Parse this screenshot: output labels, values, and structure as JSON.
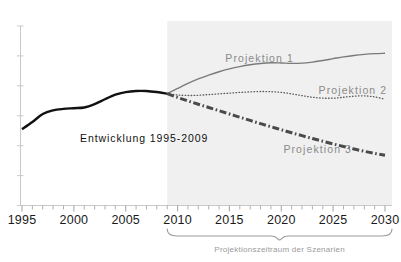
{
  "chart_data": {
    "type": "line",
    "title": "",
    "subtitle": "",
    "xlabel": "",
    "ylabel": "",
    "xlim": [
      1995,
      2030
    ],
    "ylim": [
      0,
      100
    ],
    "grid": false,
    "legend_position": "inline-annotations",
    "y_axis_labels_visible": false,
    "x_tick_labels": [
      "1995",
      "2000",
      "2005",
      "2010",
      "2015",
      "2020",
      "2025",
      "2030"
    ],
    "x_tick_values": [
      1995,
      2000,
      2005,
      2010,
      2015,
      2020,
      2025,
      2030
    ],
    "x_minor_tick_interval": 1,
    "y_minor_tick_count": 6,
    "shaded_region": {
      "label": "Projektionszeitraum",
      "x_start": 2009,
      "x_end": 2030,
      "color": "#f0f0f0"
    },
    "annotations": [
      {
        "text": "Entwicklung 1995-2009",
        "x": 2000.6,
        "y": 35.5,
        "color": "#111111"
      },
      {
        "text": "Projektion 1",
        "x": 2014.6,
        "y": 80.0,
        "color": "#8a8a8a"
      },
      {
        "text": "Projektion 2",
        "x": 2023.6,
        "y": 62.0,
        "color": "#8a8a8a"
      },
      {
        "text": "Projektion 3",
        "x": 2020.2,
        "y": 29.5,
        "color": "#8a8a8a"
      }
    ],
    "bracket": {
      "caption": "Projektionszeitraum der Szenarien",
      "x_start": 2009,
      "x_end": 2030,
      "color": "#9a9a9a"
    },
    "series": [
      {
        "name": "Entwicklung 1995-2009",
        "style": "solid",
        "width": 2.4,
        "color": "#111111",
        "x": [
          1995,
          1996,
          1997,
          1998,
          1999,
          2000,
          2001,
          2002,
          2003,
          2004,
          2005,
          2006,
          2007,
          2008,
          2009
        ],
        "values": [
          42.5,
          46.5,
          51.0,
          53.0,
          53.8,
          54.2,
          54.6,
          56.5,
          59.2,
          61.8,
          63.2,
          63.8,
          63.8,
          63.2,
          62.3
        ]
      },
      {
        "name": "Projektion 1",
        "style": "solid",
        "width": 1.4,
        "color": "#7a7a7a",
        "x": [
          2009,
          2010,
          2011,
          2012,
          2013,
          2014,
          2015,
          2016,
          2017,
          2018,
          2019,
          2020,
          2021,
          2022,
          2023,
          2024,
          2025,
          2026,
          2027,
          2028,
          2029,
          2030
        ],
        "values": [
          62.3,
          65.2,
          68.0,
          70.5,
          72.6,
          74.5,
          76.1,
          77.4,
          78.4,
          79.1,
          79.5,
          79.4,
          79.2,
          79.3,
          79.9,
          80.8,
          81.8,
          82.8,
          83.6,
          84.2,
          84.6,
          84.8
        ]
      },
      {
        "name": "Projektion 2",
        "style": "dotted",
        "width": 1.3,
        "color": "#5a5a5a",
        "x": [
          2009,
          2010,
          2011,
          2012,
          2013,
          2014,
          2015,
          2016,
          2017,
          2018,
          2019,
          2020,
          2021,
          2022,
          2023,
          2024,
          2025,
          2026,
          2027,
          2028,
          2029,
          2030
        ],
        "values": [
          62.3,
          61.6,
          61.3,
          61.4,
          61.8,
          62.2,
          62.6,
          63.0,
          63.3,
          63.5,
          63.4,
          63.0,
          62.2,
          61.2,
          60.3,
          59.8,
          59.8,
          60.3,
          60.9,
          61.1,
          60.5,
          59.2
        ]
      },
      {
        "name": "Projektion 3",
        "style": "dashdot",
        "width": 3.0,
        "color": "#4a4a4a",
        "x": [
          2009,
          2010,
          2011,
          2012,
          2013,
          2014,
          2015,
          2016,
          2017,
          2018,
          2019,
          2020,
          2021,
          2022,
          2023,
          2024,
          2025,
          2026,
          2027,
          2028,
          2029,
          2030
        ],
        "values": [
          62.3,
          60.2,
          58.3,
          56.4,
          54.6,
          52.8,
          51.0,
          49.2,
          47.4,
          45.6,
          43.9,
          42.2,
          40.5,
          38.9,
          37.3,
          35.8,
          34.3,
          32.9,
          31.5,
          30.2,
          29.0,
          28.0
        ]
      }
    ]
  }
}
